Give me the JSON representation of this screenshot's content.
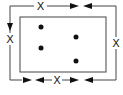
{
  "diagram": {
    "labels": {
      "top": "X",
      "left": "X",
      "right": "X",
      "bottom": "X"
    },
    "dots_count": 4,
    "colors": {
      "stroke": "#333333",
      "background": "#ffffff"
    }
  }
}
